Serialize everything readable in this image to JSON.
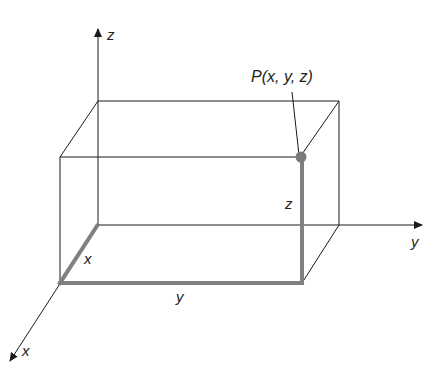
{
  "diagram": {
    "axes": {
      "z_label": "z",
      "y_label": "y",
      "x_label": "x"
    },
    "point": {
      "label": "P(x, y, z)"
    },
    "edge_labels": {
      "x": "x",
      "y": "y",
      "z": "z"
    },
    "colors": {
      "line": "#1a1a1a",
      "highlight": "#808080",
      "point": "#7a7a7a"
    }
  }
}
